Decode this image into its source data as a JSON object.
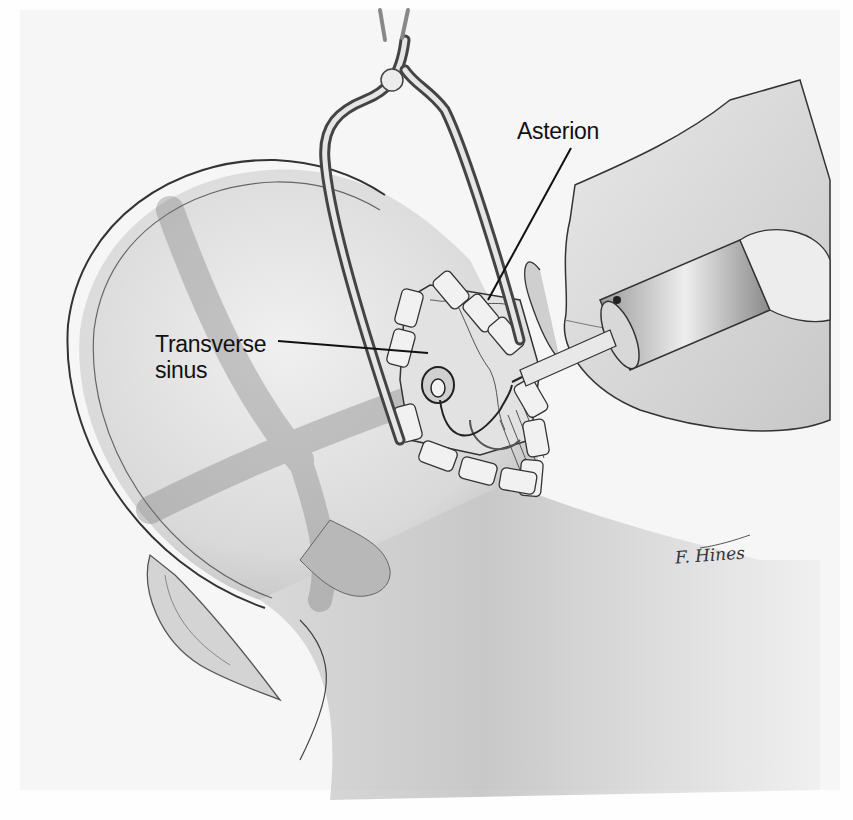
{
  "figure": {
    "type": "surgical-illustration",
    "colors": {
      "background": "#f6f6f6",
      "skin_light": "#e6e6e6",
      "skin_shadow": "#a8a8a8",
      "line": "#222222",
      "label_text": "#111111"
    }
  },
  "labels": {
    "asterion": "Asterion",
    "transverse_sinus_line1": "Transverse",
    "transverse_sinus_line2": "sinus"
  },
  "signature": "F. Hines"
}
